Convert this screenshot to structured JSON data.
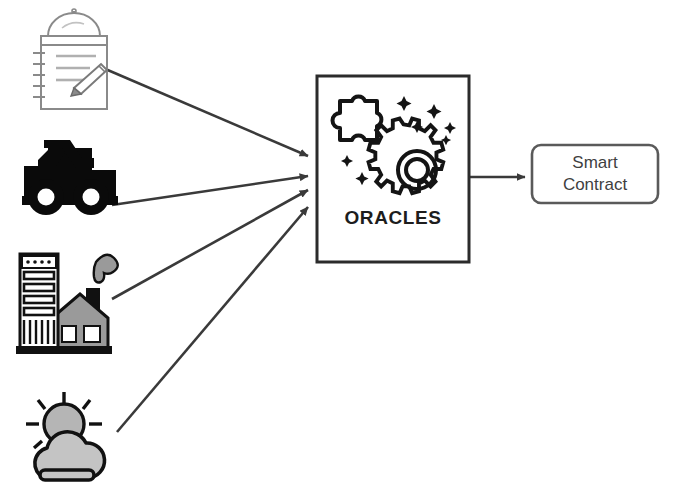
{
  "diagram": {
    "type": "flow-diagram",
    "background_color": "#ffffff",
    "stroke_color": "#3a3a3a",
    "nodes": [
      {
        "id": "notepad",
        "data_name": "data-source-notepad-icon",
        "label": "",
        "icon": "notepad-with-pencil-icon",
        "description": "Lined notepad with spiral binding, dome lid and pencil",
        "x": 30,
        "y": 14,
        "width": 78,
        "height": 96,
        "fill": "#ffffff",
        "stroke": "#7a7a7a"
      },
      {
        "id": "truck",
        "data_name": "data-source-truck-icon",
        "label": "",
        "icon": "dump-truck-icon",
        "description": "Solid black dump truck",
        "x": 22,
        "y": 140,
        "width": 104,
        "height": 72,
        "fill": "#0a0a0a",
        "stroke": "#0a0a0a"
      },
      {
        "id": "factory",
        "data_name": "data-source-factory-icon",
        "label": "",
        "icon": "factory-icon",
        "description": "Factory building with smokestack and smoke plume",
        "x": 16,
        "y": 248,
        "width": 112,
        "height": 110,
        "fill": "#9a9a9a",
        "stroke": "#111111"
      },
      {
        "id": "weather",
        "data_name": "data-source-weather-icon",
        "label": "",
        "icon": "sun-behind-cloud-icon",
        "description": "Sun partly covered by a cloud",
        "x": 18,
        "y": 390,
        "width": 110,
        "height": 98,
        "fill": "#b5b5b5",
        "stroke": "#111111"
      },
      {
        "id": "oracles",
        "data_name": "oracles-box",
        "label": "ORACLES",
        "icon": "puzzle-and-gear-icon",
        "description": "Square box containing puzzle piece, gear and sparkles",
        "x": 316,
        "y": 75,
        "width": 154,
        "height": 188,
        "fill": "#ffffff",
        "stroke": "#2b2b2b",
        "corner_radius": 0
      },
      {
        "id": "smart-contract",
        "data_name": "smart-contract-box",
        "label": "Smart\nContract",
        "label_lines": [
          "Smart",
          "Contract"
        ],
        "icon": "",
        "description": "Rounded rectangle labelled Smart Contract",
        "x": 531,
        "y": 144,
        "width": 128,
        "height": 60,
        "fill": "#ffffff",
        "stroke": "#5a5a5a",
        "corner_radius": 8
      }
    ],
    "edges": [
      {
        "id": "e1",
        "data_name": "arrow-notepad-to-oracles",
        "from": "notepad",
        "to": "oracles",
        "x1": 103,
        "y1": 68,
        "x2": 314,
        "y2": 157,
        "arrowhead": "solid-triangle"
      },
      {
        "id": "e2",
        "data_name": "arrow-truck-to-oracles",
        "from": "truck",
        "to": "oracles",
        "x1": 112,
        "y1": 205,
        "x2": 314,
        "y2": 175,
        "arrowhead": "solid-triangle"
      },
      {
        "id": "e3",
        "data_name": "arrow-factory-to-oracles",
        "from": "factory",
        "to": "oracles",
        "x1": 112,
        "y1": 298,
        "x2": 314,
        "y2": 190,
        "arrowhead": "solid-triangle"
      },
      {
        "id": "e4",
        "data_name": "arrow-weather-to-oracles",
        "from": "weather",
        "to": "oracles",
        "x1": 116,
        "y1": 432,
        "x2": 314,
        "y2": 205,
        "arrowhead": "solid-triangle"
      },
      {
        "id": "e5",
        "data_name": "arrow-oracles-to-smart-contract",
        "from": "oracles",
        "to": "smart-contract",
        "x1": 470,
        "y1": 177,
        "x2": 529,
        "y2": 177,
        "arrowhead": "solid-triangle"
      }
    ]
  },
  "labels": {
    "oracles": "ORACLES",
    "smart_contract_line1": "Smart",
    "smart_contract_line2": "Contract"
  }
}
